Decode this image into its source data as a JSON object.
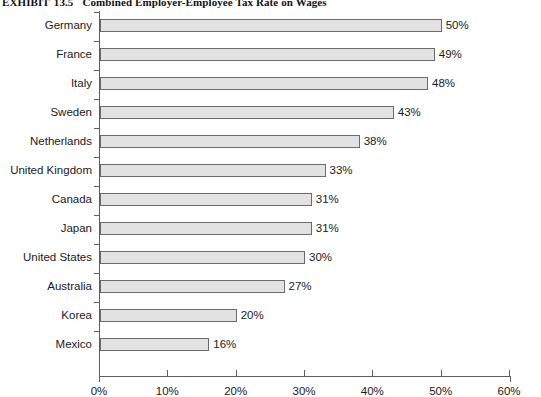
{
  "title": {
    "exhibit_label": "EXHIBIT",
    "exhibit_number": "13.5",
    "text": "Combined Employer-Employee Tax Rate on Wages"
  },
  "colors": {
    "bar_fill": "#e2e2e2",
    "bar_border": "#6b6b6b",
    "axis": "#5e5e5e",
    "text": "#1a1a1a",
    "background": "#ffffff"
  },
  "chart_data": {
    "type": "bar",
    "orientation": "horizontal",
    "title": "Combined Employer-Employee Tax Rate on Wages",
    "xlabel": "",
    "ylabel": "",
    "xlim": [
      0,
      60
    ],
    "xticks": [
      0,
      10,
      20,
      30,
      40,
      50,
      60
    ],
    "xticklabels": [
      "0%",
      "10%",
      "20%",
      "30%",
      "40%",
      "50%",
      "60%"
    ],
    "grid": false,
    "legend": false,
    "value_suffix": "%",
    "categories": [
      "Germany",
      "France",
      "Italy",
      "Sweden",
      "Netherlands",
      "United Kingdom",
      "Canada",
      "Japan",
      "United States",
      "Australia",
      "Korea",
      "Mexico"
    ],
    "values": [
      50,
      49,
      48,
      43,
      38,
      33,
      31,
      31,
      30,
      27,
      20,
      16
    ],
    "value_labels": [
      "50%",
      "49%",
      "48%",
      "43%",
      "38%",
      "33%",
      "31%",
      "31%",
      "30%",
      "27%",
      "20%",
      "16%"
    ]
  }
}
